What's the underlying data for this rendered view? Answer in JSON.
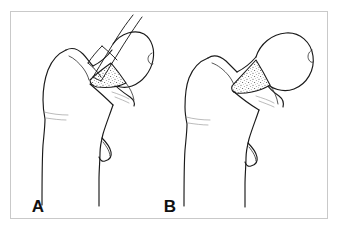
{
  "figure": {
    "kind": "medical-line-illustration",
    "background_color": "#ffffff",
    "frame_color": "#c9c9c9",
    "ink_color": "#1a1a1a",
    "stipple_color": "#444444",
    "panels": [
      {
        "id": "A",
        "label": "A",
        "label_x": 38,
        "label_y": 212,
        "description": "Osteotome positioned at the femoral head-neck junction beginning the resection",
        "has_instrument": true,
        "instrument_name": "osteotome",
        "has_stippled_cut_surface": true
      },
      {
        "id": "B",
        "label": "B",
        "label_x": 170,
        "label_y": 212,
        "description": "Proximal femur after resection showing the stippled cancellous cut surface",
        "has_instrument": false,
        "instrument_name": "",
        "has_stippled_cut_surface": true
      }
    ]
  }
}
